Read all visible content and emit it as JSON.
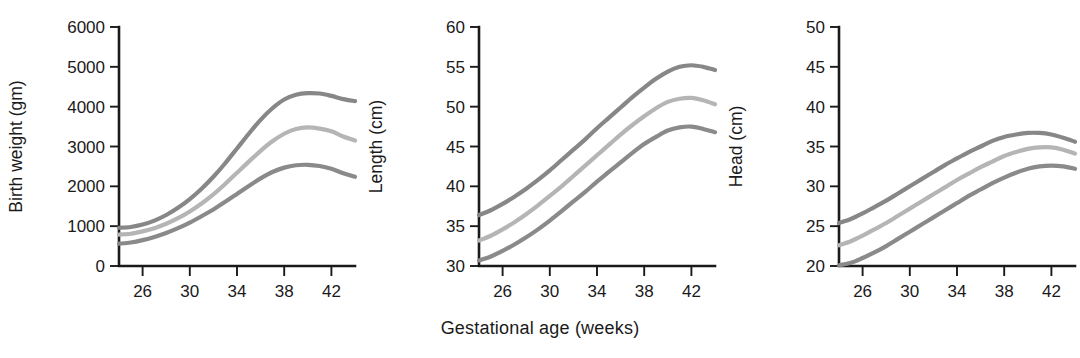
{
  "figure": {
    "shared_xlabel": "Gestational age (weeks)",
    "background": "#ffffff",
    "axis_color": "#1a1a1a"
  },
  "series_styles": {
    "upper_color": "#878787",
    "middle_color": "#b5b5b5",
    "lower_color": "#8a8a8a",
    "line_width": 4.2
  },
  "chart_data": [
    {
      "type": "line",
      "title": "",
      "xlabel": "Gestational age (weeks)",
      "ylabel": "Birth weight (gm)",
      "xlim": [
        24,
        44
      ],
      "ylim": [
        0,
        6000
      ],
      "grid": false,
      "legend": "none",
      "xticks": [
        26,
        30,
        34,
        38,
        42
      ],
      "xticklabels": [
        "26",
        "30",
        "34",
        "38",
        "42"
      ],
      "yticks": [
        0,
        1000,
        2000,
        3000,
        4000,
        5000,
        6000
      ],
      "yticklabels": [
        "0",
        "1000",
        "2000",
        "3000",
        "4000",
        "5000",
        "6000"
      ],
      "x": [
        24,
        25,
        26,
        27,
        28,
        29,
        30,
        31,
        32,
        33,
        34,
        35,
        36,
        37,
        38,
        39,
        40,
        41,
        42,
        43,
        44
      ],
      "series": [
        {
          "name": "upper percentile",
          "color": "#878787",
          "values": [
            960,
            980,
            1040,
            1140,
            1280,
            1460,
            1680,
            1940,
            2240,
            2580,
            2950,
            3320,
            3670,
            3960,
            4180,
            4300,
            4340,
            4330,
            4270,
            4190,
            4140
          ]
        },
        {
          "name": "median",
          "color": "#b5b5b5",
          "values": [
            790,
            810,
            870,
            950,
            1060,
            1200,
            1370,
            1570,
            1800,
            2060,
            2340,
            2620,
            2890,
            3130,
            3320,
            3440,
            3480,
            3450,
            3380,
            3250,
            3150
          ]
        },
        {
          "name": "lower percentile",
          "color": "#8a8a8a",
          "values": [
            560,
            590,
            650,
            730,
            830,
            950,
            1090,
            1250,
            1420,
            1610,
            1810,
            2010,
            2200,
            2360,
            2470,
            2530,
            2540,
            2510,
            2440,
            2330,
            2240
          ]
        }
      ]
    },
    {
      "type": "line",
      "title": "",
      "xlabel": "Gestational age (weeks)",
      "ylabel": "Length (cm)",
      "xlim": [
        24,
        44
      ],
      "ylim": [
        30,
        60
      ],
      "grid": false,
      "legend": "none",
      "xticks": [
        26,
        30,
        34,
        38,
        42
      ],
      "xticklabels": [
        "26",
        "30",
        "34",
        "38",
        "42"
      ],
      "yticks": [
        30,
        35,
        40,
        45,
        50,
        55,
        60
      ],
      "yticklabels": [
        "30",
        "35",
        "40",
        "45",
        "50",
        "55",
        "60"
      ],
      "x": [
        24,
        25,
        26,
        27,
        28,
        29,
        30,
        31,
        32,
        33,
        34,
        35,
        36,
        37,
        38,
        39,
        40,
        41,
        42,
        43,
        44
      ],
      "series": [
        {
          "name": "upper percentile",
          "color": "#878787",
          "values": [
            36.4,
            37.0,
            37.8,
            38.7,
            39.7,
            40.8,
            42.0,
            43.3,
            44.6,
            45.9,
            47.3,
            48.6,
            49.9,
            51.2,
            52.4,
            53.5,
            54.4,
            55.0,
            55.2,
            55.0,
            54.6
          ]
        },
        {
          "name": "median",
          "color": "#b5b5b5",
          "values": [
            33.2,
            33.8,
            34.6,
            35.5,
            36.5,
            37.6,
            38.8,
            40.0,
            41.3,
            42.6,
            43.9,
            45.2,
            46.5,
            47.7,
            48.8,
            49.8,
            50.6,
            51.0,
            51.1,
            50.8,
            50.3
          ]
        },
        {
          "name": "lower percentile",
          "color": "#8a8a8a",
          "values": [
            30.7,
            31.2,
            31.9,
            32.7,
            33.6,
            34.6,
            35.7,
            36.9,
            38.1,
            39.3,
            40.6,
            41.8,
            43.0,
            44.2,
            45.3,
            46.2,
            47.0,
            47.4,
            47.5,
            47.2,
            46.8
          ]
        }
      ]
    },
    {
      "type": "line",
      "title": "",
      "xlabel": "Gestational age (weeks)",
      "ylabel": "Head (cm)",
      "xlim": [
        24,
        44
      ],
      "ylim": [
        20,
        50
      ],
      "grid": false,
      "legend": "none",
      "xticks": [
        26,
        30,
        34,
        38,
        42
      ],
      "xticklabels": [
        "26",
        "30",
        "34",
        "38",
        "42"
      ],
      "yticks": [
        20,
        25,
        30,
        35,
        40,
        45,
        50
      ],
      "yticklabels": [
        "20",
        "25",
        "30",
        "35",
        "40",
        "45",
        "50"
      ],
      "x": [
        24,
        25,
        26,
        27,
        28,
        29,
        30,
        31,
        32,
        33,
        34,
        35,
        36,
        37,
        38,
        39,
        40,
        41,
        42,
        43,
        44
      ],
      "series": [
        {
          "name": "upper percentile",
          "color": "#878787",
          "values": [
            25.4,
            25.9,
            26.6,
            27.4,
            28.2,
            29.1,
            30.0,
            30.9,
            31.8,
            32.7,
            33.5,
            34.3,
            35.0,
            35.7,
            36.2,
            36.5,
            36.7,
            36.7,
            36.5,
            36.1,
            35.6
          ]
        },
        {
          "name": "median",
          "color": "#b5b5b5",
          "values": [
            22.6,
            23.1,
            23.8,
            24.6,
            25.4,
            26.3,
            27.2,
            28.1,
            29.0,
            29.9,
            30.8,
            31.6,
            32.4,
            33.1,
            33.8,
            34.3,
            34.7,
            34.9,
            34.9,
            34.6,
            34.1
          ]
        },
        {
          "name": "lower percentile",
          "color": "#8a8a8a",
          "values": [
            20.1,
            20.4,
            21.0,
            21.7,
            22.5,
            23.4,
            24.3,
            25.2,
            26.1,
            27.0,
            27.9,
            28.8,
            29.6,
            30.4,
            31.1,
            31.7,
            32.2,
            32.5,
            32.6,
            32.5,
            32.2
          ]
        }
      ]
    }
  ]
}
